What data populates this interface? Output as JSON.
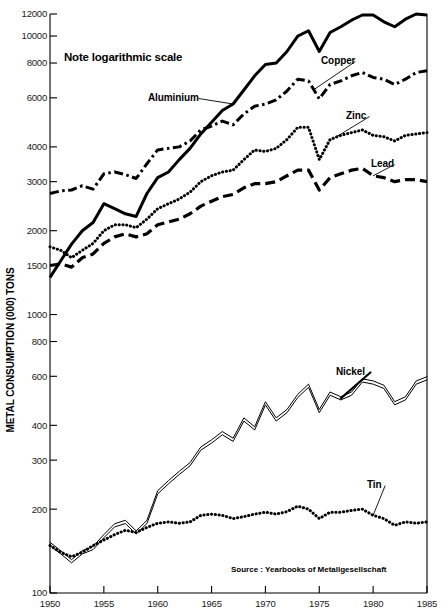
{
  "chart_data": {
    "type": "line",
    "title": "",
    "note": "Note logarithmic scale",
    "xlabel": "",
    "ylabel": "METAL CONSUMPTION (000) TONS",
    "source": "Source :  Yearbooks of Metallgesellschaft",
    "scale": "logarithmic",
    "grid": false,
    "legend_position": "inline-labels",
    "xlim": [
      1950,
      1985
    ],
    "ylim": [
      100,
      12000
    ],
    "x_ticks": [
      1950,
      1955,
      1960,
      1965,
      1970,
      1975,
      1980,
      1985
    ],
    "x_tick_labels": [
      "1950",
      "1955",
      "1960",
      "1965",
      "1970",
      "1975",
      "1980",
      "1985"
    ],
    "y_ticks": [
      100,
      200,
      300,
      400,
      600,
      800,
      1000,
      1500,
      2000,
      3000,
      4000,
      6000,
      8000,
      10000,
      12000
    ],
    "y_tick_labels": [
      "100",
      "200",
      "300",
      "400",
      "600",
      "800",
      "1000",
      "1500",
      "2000",
      "3000",
      "4000",
      "6000",
      "8000",
      "10000",
      "12000"
    ],
    "x": [
      1950,
      1951,
      1952,
      1953,
      1954,
      1955,
      1956,
      1957,
      1958,
      1959,
      1960,
      1961,
      1962,
      1963,
      1964,
      1965,
      1966,
      1967,
      1968,
      1969,
      1970,
      1971,
      1972,
      1973,
      1974,
      1975,
      1976,
      1977,
      1978,
      1979,
      1980,
      1981,
      1982,
      1983,
      1984,
      1985
    ],
    "series": [
      {
        "name": "Aluminium",
        "line_style": "solid",
        "label_x": 1965,
        "label_y": 6950,
        "values": [
          1360,
          1560,
          1790,
          2000,
          2140,
          2500,
          2400,
          2300,
          2250,
          2720,
          3100,
          3250,
          3600,
          3950,
          4450,
          4900,
          5400,
          5700,
          6400,
          7200,
          7900,
          8000,
          8800,
          10000,
          10450,
          8800,
          10300,
          10800,
          11400,
          11900,
          11900,
          11250,
          10800,
          11500,
          12000,
          11900
        ]
      },
      {
        "name": "Copper",
        "line_style": "dash-dot",
        "label_x": 1971.5,
        "label_y": 8600,
        "values": [
          2720,
          2780,
          2800,
          2900,
          2820,
          3200,
          3250,
          3180,
          3080,
          3480,
          3900,
          3950,
          4000,
          4200,
          4600,
          4750,
          4950,
          4800,
          5250,
          5600,
          5700,
          5900,
          6350,
          7000,
          6900,
          5950,
          6700,
          6900,
          7200,
          7400,
          7100,
          7000,
          6700,
          7000,
          7400,
          7500
        ]
      },
      {
        "name": "Zinc",
        "line_style": "dotted",
        "label_x": 1973,
        "label_y": 5100,
        "values": [
          1750,
          1700,
          1600,
          1700,
          1800,
          2000,
          2100,
          2100,
          2050,
          2200,
          2400,
          2500,
          2600,
          2750,
          3000,
          3150,
          3250,
          3300,
          3600,
          3900,
          3850,
          3950,
          4250,
          4700,
          4700,
          3600,
          4250,
          4400,
          4500,
          4600,
          4400,
          4350,
          4200,
          4400,
          4450,
          4500
        ]
      },
      {
        "name": "Lead",
        "line_style": "dashed",
        "label_x": 1977,
        "label_y": 3350,
        "values": [
          1500,
          1520,
          1480,
          1600,
          1650,
          1800,
          1900,
          1950,
          1900,
          1950,
          2100,
          2150,
          2200,
          2300,
          2450,
          2550,
          2650,
          2700,
          2850,
          2950,
          2950,
          3000,
          3150,
          3300,
          3300,
          2800,
          3100,
          3200,
          3300,
          3350,
          3150,
          3100,
          3000,
          3050,
          3050,
          3000
        ]
      },
      {
        "name": "Nickel",
        "line_style": "double-line",
        "label_x": 1974,
        "label_y": 700,
        "values": [
          150,
          140,
          130,
          140,
          145,
          160,
          175,
          180,
          165,
          180,
          230,
          250,
          270,
          290,
          330,
          350,
          375,
          355,
          420,
          390,
          480,
          420,
          450,
          510,
          555,
          450,
          520,
          500,
          520,
          580,
          570,
          550,
          480,
          500,
          570,
          590
        ]
      },
      {
        "name": "Tin",
        "line_style": "dotted",
        "label_x": 1975,
        "label_y": 250,
        "values": [
          148,
          140,
          135,
          140,
          148,
          155,
          162,
          168,
          165,
          172,
          178,
          180,
          178,
          180,
          190,
          192,
          190,
          185,
          188,
          192,
          195,
          192,
          196,
          205,
          200,
          185,
          195,
          195,
          198,
          200,
          190,
          185,
          175,
          180,
          178,
          180
        ]
      }
    ]
  }
}
